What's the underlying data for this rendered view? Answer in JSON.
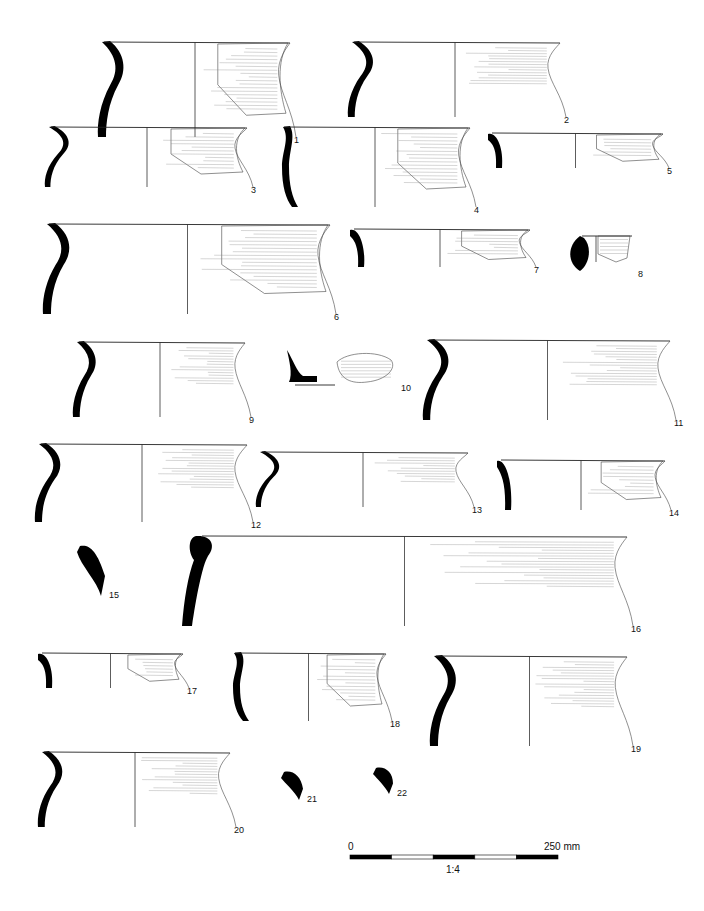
{
  "figure": {
    "type": "pottery-profile-plate",
    "vessels": [
      {
        "id": "1",
        "label": "1",
        "x": 100,
        "y": 42,
        "w": 190,
        "h": 95,
        "profile": "s-curve",
        "fragment": "partial-right"
      },
      {
        "id": "2",
        "label": "2",
        "x": 350,
        "y": 42,
        "w": 210,
        "h": 75,
        "profile": "s-curve",
        "fragment": "full-right"
      },
      {
        "id": "3",
        "label": "3",
        "x": 47,
        "y": 127,
        "w": 200,
        "h": 60,
        "profile": "s-curve",
        "fragment": "partial-right"
      },
      {
        "id": "4",
        "label": "4",
        "x": 280,
        "y": 127,
        "w": 190,
        "h": 80,
        "profile": "straight",
        "fragment": "partial-right"
      },
      {
        "id": "5",
        "label": "5",
        "x": 488,
        "y": 133,
        "w": 175,
        "h": 35,
        "profile": "short-curve",
        "fragment": "partial-right"
      },
      {
        "id": "6",
        "label": "6",
        "x": 45,
        "y": 224,
        "w": 285,
        "h": 90,
        "profile": "s-curve",
        "fragment": "partial-right"
      },
      {
        "id": "7",
        "label": "7",
        "x": 350,
        "y": 229,
        "w": 180,
        "h": 38,
        "profile": "short-curve",
        "fragment": "partial-right"
      },
      {
        "id": "8",
        "label": "8",
        "x": 572,
        "y": 236,
        "w": 62,
        "h": 35,
        "profile": "crescent",
        "fragment": "small"
      },
      {
        "id": "9",
        "label": "9",
        "x": 75,
        "y": 342,
        "w": 170,
        "h": 75,
        "profile": "s-curve",
        "fragment": "full-right"
      },
      {
        "id": "10",
        "label": "10",
        "x": 287,
        "y": 350,
        "w": 110,
        "h": 35,
        "profile": "base",
        "fragment": "base"
      },
      {
        "id": "11",
        "label": "11",
        "x": 425,
        "y": 340,
        "w": 245,
        "h": 80,
        "profile": "s-curve",
        "fragment": "full-right"
      },
      {
        "id": "12",
        "label": "12",
        "x": 37,
        "y": 444,
        "w": 210,
        "h": 78,
        "profile": "s-curve",
        "fragment": "full-right"
      },
      {
        "id": "13",
        "label": "13",
        "x": 258,
        "y": 452,
        "w": 210,
        "h": 55,
        "profile": "s-curve",
        "fragment": "full-right"
      },
      {
        "id": "14",
        "label": "14",
        "x": 497,
        "y": 460,
        "w": 168,
        "h": 50,
        "profile": "short-curve",
        "fragment": "partial-right"
      },
      {
        "id": "15",
        "label": "15",
        "x": 77,
        "y": 546,
        "w": 28,
        "h": 50,
        "profile": "rim-sherd",
        "fragment": "section-only"
      },
      {
        "id": "16",
        "label": "16",
        "x": 182,
        "y": 536,
        "w": 445,
        "h": 90,
        "profile": "thick-rim",
        "fragment": "full-right"
      },
      {
        "id": "17",
        "label": "17",
        "x": 38,
        "y": 653,
        "w": 145,
        "h": 35,
        "profile": "short-curve",
        "fragment": "partial-right"
      },
      {
        "id": "18",
        "label": "18",
        "x": 231,
        "y": 653,
        "w": 155,
        "h": 68,
        "profile": "straight",
        "fragment": "partial-right"
      },
      {
        "id": "19",
        "label": "19",
        "x": 432,
        "y": 656,
        "w": 195,
        "h": 90,
        "profile": "s-curve",
        "fragment": "full-right"
      },
      {
        "id": "20",
        "label": "20",
        "x": 40,
        "y": 752,
        "w": 190,
        "h": 75,
        "profile": "s-curve",
        "fragment": "full-right"
      },
      {
        "id": "21",
        "label": "21",
        "x": 281,
        "y": 772,
        "w": 22,
        "h": 28,
        "profile": "rim-sherd",
        "fragment": "section-only"
      },
      {
        "id": "22",
        "label": "22",
        "x": 373,
        "y": 768,
        "w": 20,
        "h": 26,
        "profile": "rim-sherd",
        "fragment": "section-only"
      }
    ]
  },
  "scale_bar": {
    "start_label": "0",
    "end_label": "250 mm",
    "ratio_label": "1:4",
    "segments": 5,
    "x": 350,
    "y": 855,
    "width": 208
  },
  "caption": {
    "text": ""
  }
}
